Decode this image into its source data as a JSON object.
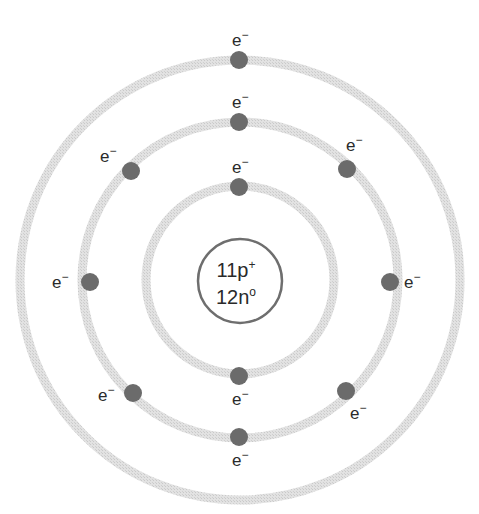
{
  "diagram": {
    "title_partial": "",
    "center": {
      "x": 240,
      "y": 280
    },
    "colors": {
      "ring": "#d9d9d9",
      "electron": "#6b6b6b",
      "nucleus_stroke": "#6e6e6e",
      "text": "#2a2a2a"
    },
    "nucleus": {
      "radius": 42,
      "protons": "11p",
      "protons_charge": "+",
      "neutrons": "12n",
      "neutrons_charge": "o"
    },
    "shells": [
      {
        "name": "inner",
        "radius": 94,
        "electron_count": 2
      },
      {
        "name": "middle",
        "radius": 158,
        "electron_count": 8
      },
      {
        "name": "outer",
        "radius": 220,
        "electron_count": 1
      }
    ],
    "electron_label": {
      "symbol": "e",
      "charge": "−"
    }
  }
}
